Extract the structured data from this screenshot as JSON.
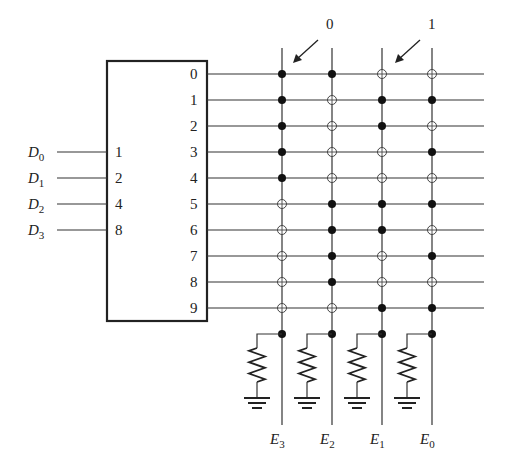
{
  "diagram": {
    "type": "decimal-to-BCD diode/switch encoder matrix",
    "decoder": {
      "inputs": [
        {
          "signal": "D",
          "sub": "0",
          "weight": "1"
        },
        {
          "signal": "D",
          "sub": "1",
          "weight": "2"
        },
        {
          "signal": "D",
          "sub": "2",
          "weight": "4"
        },
        {
          "signal": "D",
          "sub": "3",
          "weight": "8"
        }
      ],
      "outputs": [
        "0",
        "1",
        "2",
        "3",
        "4",
        "5",
        "6",
        "7",
        "8",
        "9"
      ]
    },
    "annotations": [
      {
        "label": "0",
        "points_to": "filled dot (row 0, E3)"
      },
      {
        "label": "1",
        "points_to": "open circle (row 0, E1)"
      }
    ],
    "columns": [
      {
        "signal": "E",
        "sub": "3"
      },
      {
        "signal": "E",
        "sub": "2"
      },
      {
        "signal": "E",
        "sub": "1"
      },
      {
        "signal": "E",
        "sub": "0"
      }
    ],
    "legend": {
      "filled": "0",
      "open": "1"
    },
    "matrix": [
      [
        "filled",
        "filled",
        "open",
        "open"
      ],
      [
        "filled",
        "open",
        "filled",
        "filled"
      ],
      [
        "filled",
        "open",
        "filled",
        "open"
      ],
      [
        "filled",
        "open",
        "open",
        "filled"
      ],
      [
        "filled",
        "open",
        "open",
        "open"
      ],
      [
        "open",
        "filled",
        "filled",
        "filled"
      ],
      [
        "open",
        "filled",
        "filled",
        "open"
      ],
      [
        "open",
        "filled",
        "open",
        "filled"
      ],
      [
        "open",
        "filled",
        "open",
        "open"
      ],
      [
        "open",
        "open",
        "filled",
        "filled"
      ]
    ],
    "pulldown": "resistor to ground on each column"
  }
}
